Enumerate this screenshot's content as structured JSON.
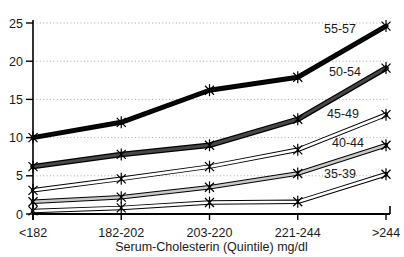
{
  "chart_data": {
    "type": "line",
    "title": "",
    "xlabel": "Serum-Cholesterin (Quintile) mg/dl",
    "ylabel": "",
    "ylim": [
      0,
      25
    ],
    "yticks": [
      0,
      5,
      10,
      15,
      20,
      25
    ],
    "grid": "horizontal-dotted",
    "legend_position": "inline-labels-near-lines",
    "categories": [
      "<182",
      "182-202",
      "203-220",
      "221-244",
      ">244"
    ],
    "series": [
      {
        "name": "55-57",
        "values": [
          10,
          12,
          16.2,
          17.9,
          24.6
        ],
        "style": {
          "outline": "#000000",
          "outlineWidth": 5,
          "core": "#0a0a0a",
          "coreWidth": 2
        },
        "label_pos": {
          "x": 340,
          "y": 28
        }
      },
      {
        "name": "50-54",
        "values": [
          6.2,
          7.8,
          9.0,
          12.4,
          19.1
        ],
        "style": {
          "outline": "#000000",
          "outlineWidth": 5.5,
          "core": "#474747",
          "coreWidth": 3
        },
        "label_pos": {
          "x": 345,
          "y": 71
        }
      },
      {
        "name": "45-49",
        "values": [
          3.1,
          4.6,
          6.2,
          8.4,
          13.0
        ],
        "style": {
          "outline": "#000000",
          "outlineWidth": 4.5,
          "core": "#ffffff",
          "coreWidth": 2.6
        },
        "label_pos": {
          "x": 343,
          "y": 113
        }
      },
      {
        "name": "40-44",
        "values": [
          1.6,
          2.2,
          3.5,
          5.3,
          9.0
        ],
        "style": {
          "outline": "#000000",
          "outlineWidth": 4.5,
          "core": "#c9c9c9",
          "coreWidth": 2.6
        },
        "label_pos": {
          "x": 348,
          "y": 142
        }
      },
      {
        "name": "35-39",
        "values": [
          0.4,
          0.8,
          1.5,
          1.6,
          5.2
        ],
        "style": {
          "outline": "#000000",
          "outlineWidth": 4.5,
          "core": "#ffffff",
          "coreWidth": 2.6
        },
        "label_pos": {
          "x": 340,
          "y": 173
        }
      }
    ],
    "marker": "star",
    "axis_color": "#000000",
    "grid_color": "#9a9a9a",
    "text_color": "#1a1a1a"
  }
}
